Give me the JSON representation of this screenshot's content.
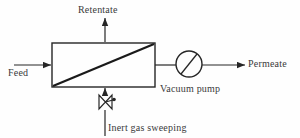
{
  "diagram": {
    "stroke_color": "#262626",
    "text_color": "#3a3a3a",
    "background": "#fefefe",
    "labels": {
      "retentate": "Retentate",
      "feed": "Feed",
      "permeate": "Permeate",
      "vacuum_pump": "Vacuum pump",
      "inert_gas": "Inert gas sweeping"
    },
    "nodes": [
      {
        "id": "membrane-module",
        "type": "rectangle-with-diagonal",
        "label": ""
      },
      {
        "id": "vacuum-pump",
        "type": "circle-with-diagonal",
        "label": "Vacuum pump"
      },
      {
        "id": "sweep-valve",
        "type": "bowtie-valve",
        "label": ""
      }
    ],
    "streams": [
      {
        "id": "feed-stream",
        "label": "Feed",
        "direction": "right",
        "into": "membrane-module"
      },
      {
        "id": "retentate-stream",
        "label": "Retentate",
        "direction": "up",
        "from": "membrane-module"
      },
      {
        "id": "permeate-stream",
        "label": "Permeate",
        "direction": "right",
        "from": "vacuum-pump"
      },
      {
        "id": "inert-gas-stream",
        "label": "Inert gas sweeping",
        "direction": "up",
        "into": "membrane-module"
      }
    ]
  }
}
